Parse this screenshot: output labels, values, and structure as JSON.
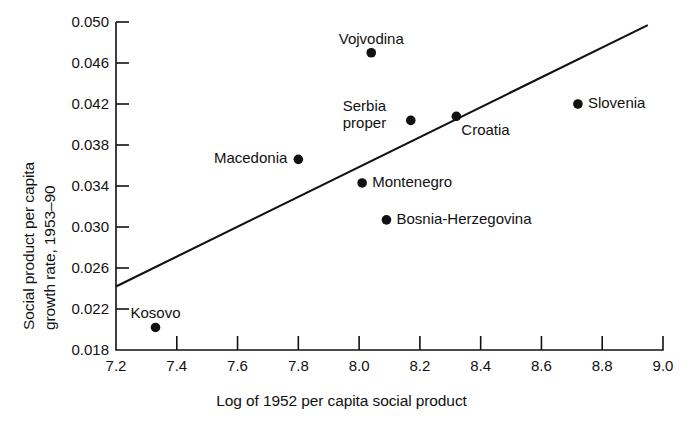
{
  "chart_data": {
    "type": "scatter",
    "title": "",
    "title_clipped_partial": "",
    "xlabel": "Log of 1952 per capita social product",
    "ylabel": "Social product per capita growth rate, 1953–90",
    "ylabel_lines": [
      "Social product per capita",
      "growth rate, 1953–90"
    ],
    "xlim": [
      7.2,
      9.0
    ],
    "ylim": [
      0.018,
      0.05
    ],
    "xticks": [
      "7.2",
      "7.4",
      "7.6",
      "7.8",
      "8.0",
      "8.2",
      "8.4",
      "8.6",
      "8.8",
      "9.0"
    ],
    "xtick_values": [
      7.2,
      7.4,
      7.6,
      7.8,
      8.0,
      8.2,
      8.4,
      8.6,
      8.8,
      9.0
    ],
    "yticks": [
      "0.050",
      "0.046",
      "0.042",
      "0.038",
      "0.034",
      "0.030",
      "0.026",
      "0.022",
      "0.018"
    ],
    "ytick_values": [
      0.05,
      0.046,
      0.042,
      0.038,
      0.034,
      0.03,
      0.026,
      0.022,
      0.018
    ],
    "grid": false,
    "legend": "none",
    "marker_color": "#111111",
    "line_color": "#111111",
    "points": [
      {
        "name": "Kosovo",
        "x": 7.33,
        "y": 0.0202,
        "label_pos": "above"
      },
      {
        "name": "Macedonia",
        "x": 7.8,
        "y": 0.0366,
        "label_pos": "left"
      },
      {
        "name": "Vojvodina",
        "x": 8.04,
        "y": 0.047,
        "label_pos": "above"
      },
      {
        "name": "Serbia proper",
        "x": 8.17,
        "y": 0.0404,
        "label_pos": "left"
      },
      {
        "name": "Montenegro",
        "x": 8.01,
        "y": 0.0343,
        "label_pos": "right"
      },
      {
        "name": "Bosnia-Herzegovina",
        "x": 8.09,
        "y": 0.0307,
        "label_pos": "right"
      },
      {
        "name": "Croatia",
        "x": 8.32,
        "y": 0.0408,
        "label_pos": "below-right"
      },
      {
        "name": "Slovenia",
        "x": 8.72,
        "y": 0.042,
        "label_pos": "right"
      }
    ],
    "trendline": {
      "x_start": 7.2,
      "y_start": 0.0242,
      "x_end": 8.95,
      "y_end": 0.0497
    }
  }
}
